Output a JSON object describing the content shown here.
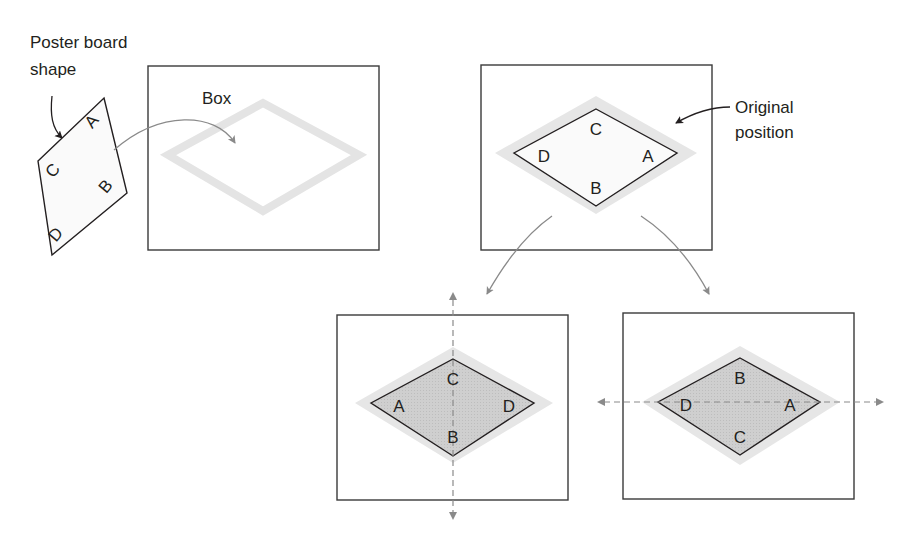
{
  "colors": {
    "outline": "#231f20",
    "arrow": "#8a8a8a",
    "box_outline": "#3a3a3a",
    "shadow_outline": "#e2e2e2",
    "fill_light": "#f7f7f7",
    "fill_dark": "#c9c9c9",
    "axis": "#8a8a8a"
  },
  "labels": {
    "poster_board_line1": "Poster board",
    "poster_board_line2": "shape",
    "box": "Box",
    "original_line1": "Original",
    "original_line2": "position"
  },
  "shapes": {
    "poster_board": {
      "vertices": [
        "A",
        "B",
        "D",
        "C"
      ]
    },
    "original": {
      "top": "C",
      "right": "A",
      "bottom": "B",
      "left": "D"
    },
    "flip_vertical_axis": {
      "top": "C",
      "right": "D",
      "bottom": "B",
      "left": "A",
      "axis": "vertical"
    },
    "flip_horizontal_axis": {
      "top": "B",
      "right": "A",
      "bottom": "C",
      "left": "D",
      "axis": "horizontal"
    }
  }
}
